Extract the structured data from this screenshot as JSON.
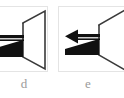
{
  "figure": {
    "background_color": "#ffffff",
    "panel_border_color": "#e4e4e4",
    "caption_color": "#9a9a9a",
    "stroke_color": "#2b2b2b",
    "fill_color": "#111111",
    "panels": [
      {
        "id": "d",
        "caption": "d",
        "clipped_edge": "left",
        "elements": [
          {
            "name": "cone-outline",
            "type": "trapezoid",
            "description": "open horn / cone outline, narrow at left, wide at right"
          },
          {
            "name": "axis-arrow",
            "type": "arrow",
            "direction": "left",
            "description": "horizontal shaft with leftward arrowhead"
          },
          {
            "name": "wedge",
            "type": "filled-triangle",
            "description": "solid black wedge below the arrow, apex at right"
          }
        ]
      },
      {
        "id": "e",
        "caption": "e",
        "clipped_edge": "right",
        "elements": [
          {
            "name": "cone-outline",
            "type": "trapezoid",
            "description": "open horn / cone outline, narrow at left, wide at right"
          },
          {
            "name": "axis-arrow",
            "type": "arrow",
            "direction": "left",
            "description": "horizontal shaft with leftward arrowhead"
          },
          {
            "name": "wedge",
            "type": "filled-triangle",
            "description": "solid black wedge below the arrow, apex at right"
          }
        ]
      }
    ]
  }
}
